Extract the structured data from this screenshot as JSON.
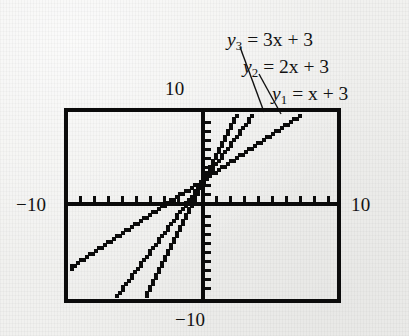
{
  "figure": {
    "kind": "graphing-calculator-screen",
    "ink_color": "#0b0b0b",
    "paper_color": "#f1f1ef"
  },
  "axis_labels": {
    "top": "10",
    "left": "−10",
    "right": "10",
    "bottom": "−10"
  },
  "callouts": [
    {
      "id": "y3",
      "var": "y",
      "sub": "3",
      "equation": "= 3x + 3"
    },
    {
      "id": "y2",
      "var": "y",
      "sub": "2",
      "equation": "= 2x + 3"
    },
    {
      "id": "y1",
      "var": "y",
      "sub": "1",
      "equation": "= x + 3"
    }
  ],
  "chart_data": {
    "type": "line",
    "title": "",
    "subtitle": "",
    "xlabel": "",
    "ylabel": "",
    "xlim": [
      -10,
      10
    ],
    "ylim": [
      -10,
      10
    ],
    "grid": false,
    "legend_position": "callout-labels-above-plot",
    "x_tick_step": 1,
    "y_tick_step": 1,
    "x_ticks": [
      -10,
      -9,
      -8,
      -7,
      -6,
      -5,
      -4,
      -3,
      -2,
      -1,
      0,
      1,
      2,
      3,
      4,
      5,
      6,
      7,
      8,
      9,
      10
    ],
    "y_ticks": [
      -10,
      -9,
      -8,
      -7,
      -6,
      -5,
      -4,
      -3,
      -2,
      -1,
      0,
      1,
      2,
      3,
      4,
      5,
      6,
      7,
      8,
      9,
      10
    ],
    "tick_labels_shown": false,
    "axis_end_labels": [
      "10",
      "−10",
      "10",
      "−10"
    ],
    "rendering": "pixelated stair-stepped calculator plot",
    "series": [
      {
        "name": "y1 = x + 3",
        "label": "y₁ = x + 3",
        "slope": 1,
        "intercept": 3,
        "x": [
          -10,
          7
        ],
        "values": [
          -7,
          10
        ]
      },
      {
        "name": "y2 = 2x + 3",
        "label": "y₂ = 2x + 3",
        "slope": 2,
        "intercept": 3,
        "x": [
          -6.5,
          3.5
        ],
        "values": [
          -10,
          10
        ]
      },
      {
        "name": "y3 = 3x + 3",
        "label": "y₃ = 3x + 3",
        "slope": 3,
        "intercept": 3,
        "x": [
          -4.33,
          2.33
        ],
        "values": [
          -10,
          10
        ]
      }
    ],
    "common_point": {
      "x": 0,
      "y": 3,
      "description": "all three lines share the y-intercept (0, 3)"
    }
  }
}
